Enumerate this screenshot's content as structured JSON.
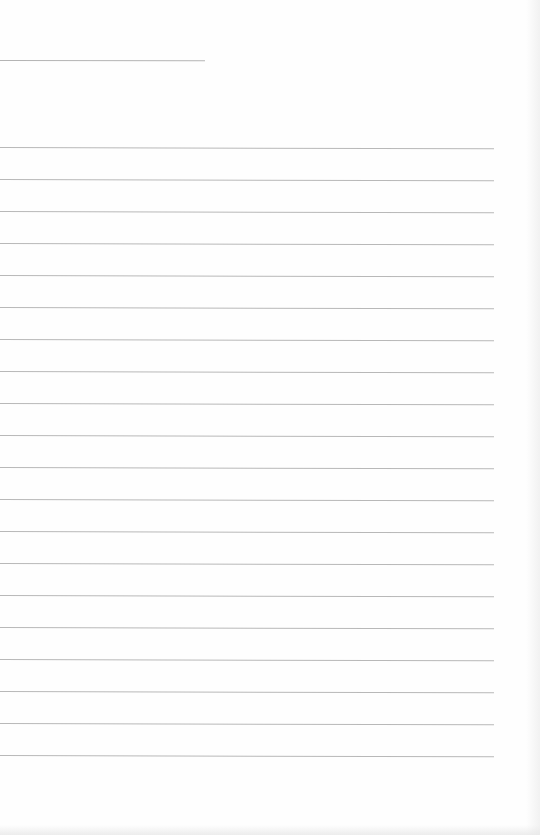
{
  "document": {
    "type": "lined-paper",
    "header_rule": {
      "y": 60,
      "length": 205
    },
    "rules": {
      "count": 20,
      "first_y": 147,
      "spacing": 32,
      "length": 494
    },
    "colors": {
      "paper": "#fefefe",
      "rule": "#b8b8b8"
    },
    "bleed_through": [
      {
        "x": 180,
        "text": ""
      },
      {
        "x": 292,
        "text": ""
      }
    ]
  }
}
